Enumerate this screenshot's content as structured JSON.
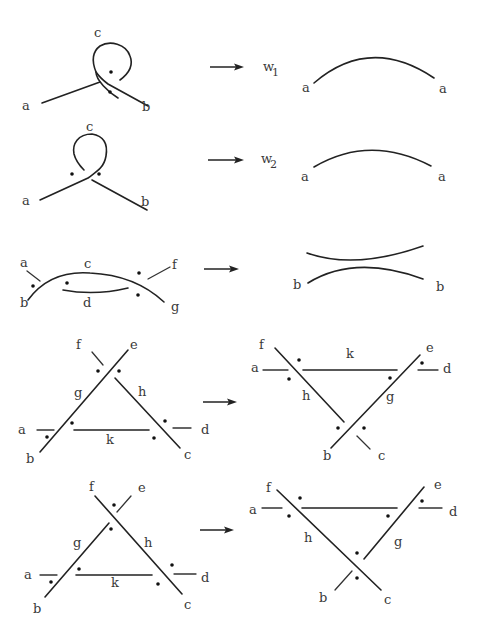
{
  "figure": {
    "rows": [
      {
        "id": "row1",
        "left_labels": {
          "a": "a",
          "b": "b",
          "c": "c"
        },
        "arrow": "→",
        "weight_symbol": "w",
        "weight_index": "1",
        "right_labels": {
          "left": "a",
          "right": "a"
        }
      },
      {
        "id": "row2",
        "left_labels": {
          "a": "a",
          "b": "b",
          "c": "c"
        },
        "arrow": "→",
        "weight_symbol": "w",
        "weight_index": "2",
        "right_labels": {
          "left": "a",
          "right": "a"
        }
      },
      {
        "id": "row3",
        "left_labels": {
          "a": "a",
          "b": "b",
          "c": "c",
          "d": "d",
          "f": "f",
          "g": "g"
        },
        "arrow": "→",
        "right_labels": {
          "left": "b",
          "right": "b"
        }
      },
      {
        "id": "row4",
        "left_labels": {
          "a": "a",
          "b": "b",
          "c": "c",
          "d": "d",
          "e": "e",
          "f": "f",
          "g": "g",
          "h": "h",
          "k": "k"
        },
        "arrow": "→",
        "right_labels": {
          "a": "a",
          "b": "b",
          "c": "c",
          "d": "d",
          "e": "e",
          "f": "f",
          "g": "g",
          "h": "h",
          "k": "k"
        }
      },
      {
        "id": "row5",
        "left_labels": {
          "a": "a",
          "b": "b",
          "c": "c",
          "d": "d",
          "e": "e",
          "f": "f",
          "g": "g",
          "h": "h",
          "k": "k"
        },
        "arrow": "→",
        "right_labels": {
          "a": "a",
          "b": "b",
          "c": "c",
          "d": "d",
          "e": "e",
          "f": "f",
          "g": "g",
          "h": "h"
        }
      }
    ]
  }
}
